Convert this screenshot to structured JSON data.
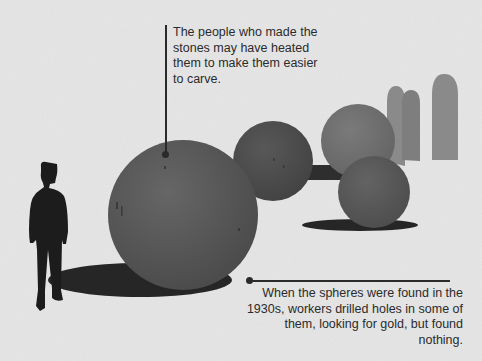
{
  "illustration": {
    "subject": "Stone spheres with human silhouette for scale",
    "colors": {
      "background": "#e6e6e6",
      "sphere_front": "#5a5a5a",
      "sphere_mid": "#4e4e4e",
      "sphere_back": "#6e6e6e",
      "sphere_right": "#585858",
      "distant_stones": "#8a8a8a",
      "shadow": "#262626",
      "silhouette": "#1c1c1c",
      "text": "#2b2b2b"
    }
  },
  "annotations": {
    "top": {
      "text": "The people who made the stones may have heated them to make them easier to carve."
    },
    "bottom": {
      "text": "When the spheres were found in the 1930s, workers drilled holes in some of them, looking for gold, but found nothing."
    }
  }
}
